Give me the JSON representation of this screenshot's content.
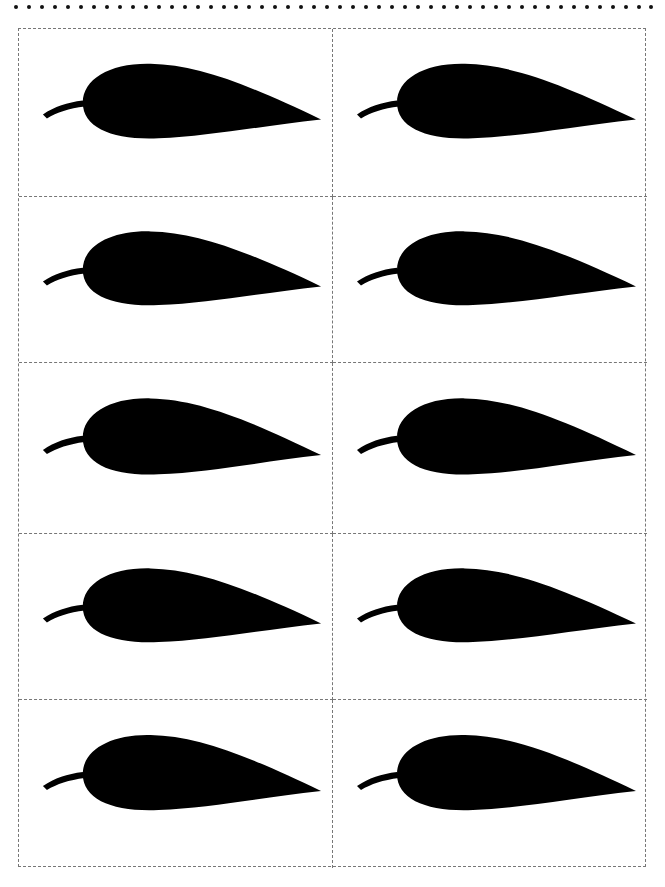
{
  "page": {
    "header_dot_count": 50,
    "grid": {
      "columns": 2,
      "rows": 5
    },
    "cells": [
      {
        "shape": "leaf-silhouette",
        "color": "#000000"
      },
      {
        "shape": "leaf-silhouette",
        "color": "#000000"
      },
      {
        "shape": "leaf-silhouette",
        "color": "#000000"
      },
      {
        "shape": "leaf-silhouette",
        "color": "#000000"
      },
      {
        "shape": "leaf-silhouette",
        "color": "#000000"
      },
      {
        "shape": "leaf-silhouette",
        "color": "#000000"
      },
      {
        "shape": "leaf-silhouette",
        "color": "#000000"
      },
      {
        "shape": "leaf-silhouette",
        "color": "#000000"
      },
      {
        "shape": "leaf-silhouette",
        "color": "#000000"
      },
      {
        "shape": "leaf-silhouette",
        "color": "#000000"
      }
    ],
    "border_color": "#777777"
  }
}
